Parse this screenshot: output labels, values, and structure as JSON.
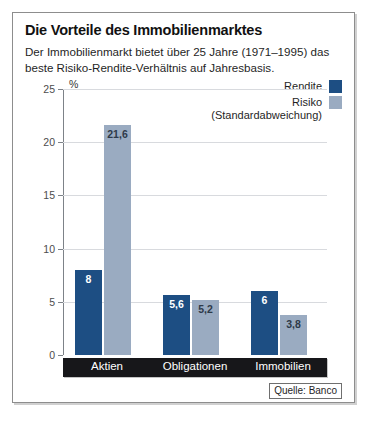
{
  "chart_data": {
    "type": "bar",
    "title": "Die Vorteile des Immobilienmarktes",
    "subtitle": "Der Immobilienmarkt bietet über 25 Jahre (1971–1995) das beste Risiko-Rendite-Verhältnis auf Jahresbasis.",
    "categories": [
      "Aktien",
      "Obligationen",
      "Immobilien"
    ],
    "series": [
      {
        "name": "Rendite",
        "color": "#1d4e83",
        "values": [
          8,
          5.6,
          6
        ],
        "labels": [
          "8",
          "5,6",
          "6"
        ]
      },
      {
        "name": "Risiko\n(Standardabweichung)",
        "color": "#9aabc1",
        "values": [
          21.6,
          5.2,
          3.8
        ],
        "labels": [
          "21,6",
          "5,2",
          "3,8"
        ]
      }
    ],
    "xlabel": "",
    "ylabel": "%",
    "ylim": [
      0,
      25
    ],
    "yticks": [
      0,
      5,
      10,
      15,
      20,
      25
    ],
    "ytick_labels": [
      "0",
      "5",
      "10",
      "15",
      "20",
      "25"
    ],
    "grid": true,
    "legend_position": "top-right",
    "source": "Quelle: Banco"
  },
  "legend": {
    "items": [
      {
        "label": "Rendite",
        "color": "#1d4e83"
      },
      {
        "label": "Risiko\n(Standardabweichung)",
        "color": "#9aabc1"
      }
    ]
  },
  "axis": {
    "unit": "%"
  },
  "source": {
    "text": "Quelle: Banco"
  }
}
